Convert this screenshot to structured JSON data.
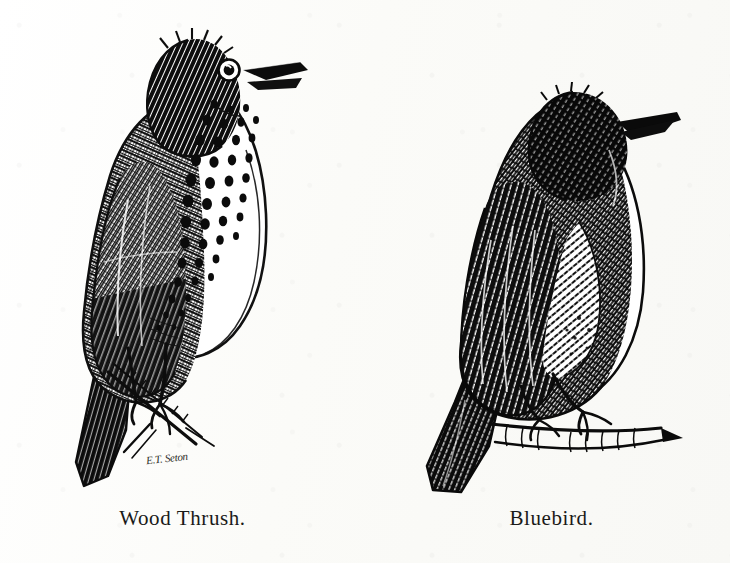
{
  "plate": {
    "medium": "pen-and-ink engraving",
    "background_color": "#fdfdfb",
    "ink_color": "#111111",
    "figures": [
      {
        "id": "wood-thrush",
        "caption": "Wood Thrush.",
        "signature": "E.T. Seton",
        "pose": "perched on a diagonal twig, body facing left, head turned right, beak open",
        "markings": "heavily spotted white breast, crosshatched brown back, long dark tail"
      },
      {
        "id": "bluebird",
        "caption": "Bluebird.",
        "pose": "perched on a horizontal twig, back to viewer, head turned right",
        "markings": "dense dark stippled back and head, pale white belly, pointed beak"
      }
    ]
  }
}
